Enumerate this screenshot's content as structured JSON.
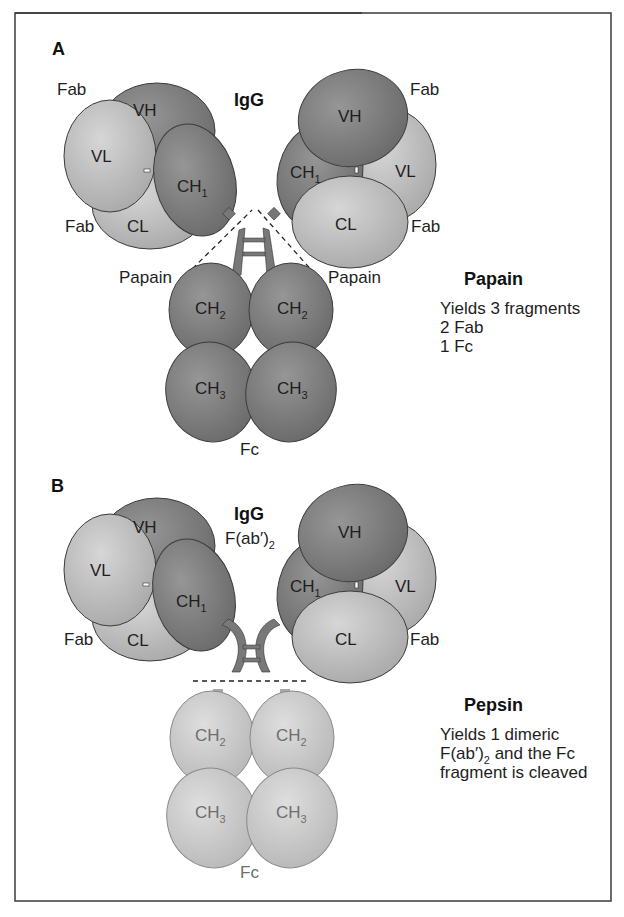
{
  "figure": {
    "border_color": "#3a3a3a",
    "colors": {
      "heavy_chain": "#7d7d7d",
      "light_chain": "#bdbdbd",
      "cleaved_fc": "#c6c6c6",
      "hinge": "#6f6f6f",
      "outline": "#3c3c3c",
      "background": "#ffffff"
    }
  },
  "panel_a": {
    "letter": "A",
    "title": "IgG",
    "fab_labels": [
      "Fab",
      "Fab",
      "Fab",
      "Fab"
    ],
    "domains": {
      "vh": "VH",
      "vl": "VL",
      "ch1": "CH",
      "ch1_sub": "1",
      "cl": "CL",
      "ch2": "CH",
      "ch2_sub": "2",
      "ch3": "CH",
      "ch3_sub": "3"
    },
    "cleavage_labels": [
      "Papain",
      "Papain"
    ],
    "fc_label": "Fc",
    "enzyme": {
      "name": "Papain",
      "description": [
        "Yields 3 fragments",
        "2 Fab",
        "1 Fc"
      ]
    }
  },
  "panel_b": {
    "letter": "B",
    "title": "IgG",
    "subtitle_main": "F(ab′)",
    "subtitle_sub": "2",
    "fab_labels": [
      "Fab",
      "Fab"
    ],
    "domains": {
      "vh": "VH",
      "vl": "VL",
      "ch1": "CH",
      "ch1_sub": "1",
      "cl": "CL",
      "ch2": "CH",
      "ch2_sub": "2",
      "ch3": "CH",
      "ch3_sub": "3"
    },
    "fc_label": "Fc",
    "enzyme": {
      "name": "Pepsin",
      "description_line1": "Yields 1 dimeric",
      "description_line2_main": "F(ab′)",
      "description_line2_sub": "2",
      "description_line2_rest": " and the Fc",
      "description_line3": "fragment is cleaved"
    }
  }
}
